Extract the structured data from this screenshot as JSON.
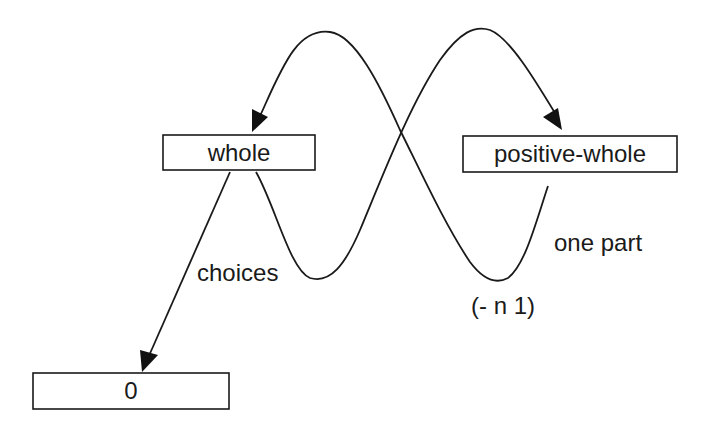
{
  "diagram": {
    "nodes": {
      "whole": {
        "label": "whole"
      },
      "positive_whole": {
        "label": "positive-whole"
      },
      "zero": {
        "label": "0"
      }
    },
    "edge_labels": {
      "choices": "choices",
      "one_part": "one part",
      "minus_n_1": "(- n 1)"
    },
    "edges": [
      {
        "from": "whole",
        "to": "zero",
        "label": "choices"
      },
      {
        "from": "whole",
        "to": "positive-whole",
        "label": "choices"
      },
      {
        "from": "positive-whole",
        "to": "whole",
        "label": "one part / (- n 1)"
      }
    ],
    "colors": {
      "stroke": "#1a1a1a",
      "background": "#ffffff"
    }
  }
}
